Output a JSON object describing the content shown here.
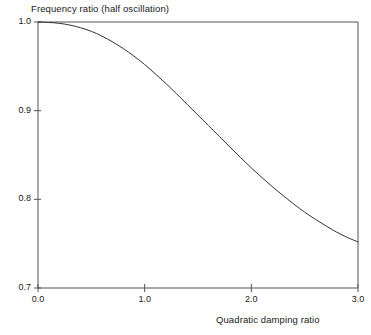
{
  "chart_data": {
    "type": "line",
    "title": "Frequency ratio (half oscillation)",
    "xlabel": "Quadratic damping ratio",
    "ylabel": "",
    "xlim": [
      0.0,
      3.0
    ],
    "ylim": [
      0.7,
      1.0
    ],
    "grid": false,
    "legend": null,
    "xticks": [
      "0.0",
      "1.0",
      "2.0",
      "3.0"
    ],
    "xtick_values": [
      0.0,
      1.0,
      2.0,
      3.0
    ],
    "yticks": [
      "0.7",
      "0.8",
      "0.9",
      "1.0"
    ],
    "ytick_values": [
      0.7,
      0.8,
      0.9,
      1.0
    ],
    "series": [
      {
        "name": "Frequency ratio",
        "color": "#333333",
        "x": [
          0.0,
          0.1,
          0.2,
          0.3,
          0.4,
          0.5,
          0.6,
          0.7,
          0.8,
          0.9,
          1.0,
          1.1,
          1.2,
          1.3,
          1.4,
          1.5,
          1.6,
          1.7,
          1.8,
          1.9,
          2.0,
          2.1,
          2.2,
          2.3,
          2.4,
          2.5,
          2.6,
          2.7,
          2.8,
          2.9,
          3.0
        ],
        "values": [
          1.0,
          0.9995,
          0.9985,
          0.9965,
          0.9935,
          0.9895,
          0.984,
          0.9775,
          0.97,
          0.9615,
          0.952,
          0.9415,
          0.9305,
          0.919,
          0.907,
          0.895,
          0.883,
          0.871,
          0.859,
          0.847,
          0.8355,
          0.8245,
          0.814,
          0.804,
          0.7945,
          0.7855,
          0.7775,
          0.77,
          0.763,
          0.757,
          0.752
        ]
      }
    ]
  },
  "axes": {
    "plot_left_px": 38,
    "plot_right_px": 358,
    "plot_top_px": 22,
    "plot_bottom_px": 288,
    "frame_color": "#555555",
    "background": "#ffffff"
  }
}
